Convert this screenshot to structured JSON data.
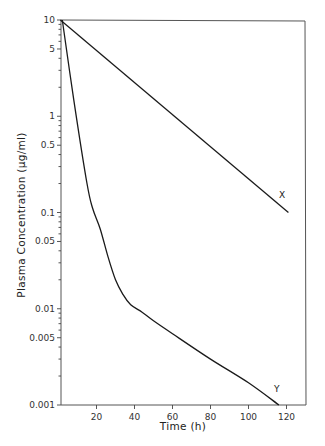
{
  "chart_data": {
    "type": "line",
    "title": "",
    "xlabel": "Time (h)",
    "ylabel": "Plasma Concentration (µg/ml)",
    "xlim": [
      0,
      130
    ],
    "ylim": [
      0.001,
      10
    ],
    "yscale": "log",
    "grid": false,
    "legend": "none (curves labeled inline)",
    "x_ticks": [
      20,
      40,
      60,
      80,
      100,
      120
    ],
    "x_tick_labels": [
      "20",
      "40",
      "60",
      "80",
      "100",
      "120"
    ],
    "y_ticks": [
      10,
      5,
      1,
      0.5,
      0.1,
      0.05,
      0.01,
      0.005,
      0.001
    ],
    "y_tick_labels": [
      "10",
      "5",
      "1",
      "0.5",
      "0.1",
      "0.05",
      "0.01",
      "0.005",
      "0.001"
    ],
    "series": [
      {
        "name": "X",
        "description": "mono-exponential decline",
        "x": [
          1,
          121
        ],
        "y": [
          10,
          0.1
        ]
      },
      {
        "name": "Y",
        "description": "bi-exponential decline (rapid distribution phase then slow elimination)",
        "x": [
          2,
          8,
          15,
          18,
          22,
          26,
          30,
          34,
          38,
          44,
          50,
          60,
          80,
          100,
          116
        ],
        "y": [
          10,
          1.5,
          0.2,
          0.11,
          0.067,
          0.035,
          0.02,
          0.014,
          0.011,
          0.0092,
          0.0075,
          0.0055,
          0.003,
          0.0017,
          0.001
        ]
      }
    ],
    "annotations": [
      {
        "text": "X",
        "x": 118,
        "y": 0.15
      },
      {
        "text": "Y",
        "x": 114,
        "y": 0.0015
      }
    ]
  },
  "labels": {
    "xlabel": "Time (h)",
    "ylabel": "Plasma Concentration (µg/ml)",
    "curve_x": "X",
    "curve_y": "Y"
  }
}
